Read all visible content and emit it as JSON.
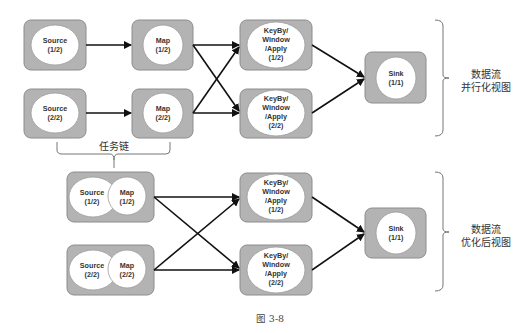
{
  "figure": {
    "caption": "图 3-8",
    "parallel_view": {
      "label_line1": "数据流",
      "label_line2": "并行化视图",
      "nodes": {
        "source_1": {
          "name": "Source",
          "index": "(1/2)"
        },
        "source_2": {
          "name": "Source",
          "index": "(2/2)"
        },
        "map_1": {
          "name": "Map",
          "index": "(1/2)"
        },
        "map_2": {
          "name": "Map",
          "index": "(2/2)"
        },
        "keyby_1": {
          "line1": "KeyBy/",
          "line2": "Window",
          "line3": "/Apply",
          "index": "(1/2)"
        },
        "keyby_2": {
          "line1": "KeyBy/",
          "line2": "Window",
          "line3": "/Apply",
          "index": "(2/2)"
        },
        "sink": {
          "name": "Sink",
          "index": "(1/1)"
        }
      }
    },
    "task_chain_label": "任务链",
    "optimized_view": {
      "label_line1": "数据流",
      "label_line2": "优化后视图",
      "nodes": {
        "chain_1": {
          "source": "Source",
          "source_index": "(1/2)",
          "map": "Map",
          "map_index": "(1/2)"
        },
        "chain_2": {
          "source": "Source",
          "source_index": "(2/2)",
          "map": "Map",
          "map_index": "(2/2)"
        },
        "keyby_1": {
          "line1": "KeyBy/",
          "line2": "Window",
          "line3": "/Apply",
          "index": "(1/2)"
        },
        "keyby_2": {
          "line1": "KeyBy/",
          "line2": "Window",
          "line3": "/Apply",
          "index": "(2/2)"
        },
        "sink": {
          "name": "Sink",
          "index": "(1/1)"
        }
      }
    },
    "colors": {
      "box_fill": "#b3b3b3",
      "node_fill": "#ffffff",
      "edge": "#111111"
    }
  }
}
